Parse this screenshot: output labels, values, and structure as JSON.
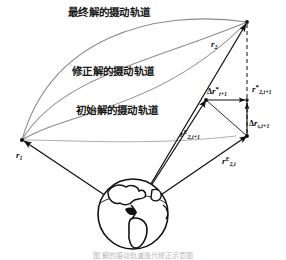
{
  "figure": {
    "background_color": "#ffffff",
    "ink_color": "#111111",
    "arc_color": "#8c8c8c",
    "title_caption": "图    解的摄动轨道迭代修正示意图"
  },
  "trajectory_labels": [
    {
      "id": "final",
      "text": "最终解的摄动轨道",
      "x": 68,
      "y": 7
    },
    {
      "id": "corrected",
      "text": "修正解的摄动轨道",
      "x": 72,
      "y": 66
    },
    {
      "id": "initial",
      "text": "初始解的摄动轨道",
      "x": 76,
      "y": 105
    }
  ],
  "vector_labels": [
    {
      "id": "r1",
      "base": "r",
      "sup": "",
      "sub": "1",
      "star": false,
      "x": 16,
      "y": 151
    },
    {
      "id": "r2",
      "base": "r",
      "sup": "",
      "sub": "2",
      "star": false,
      "x": 211,
      "y": 40
    },
    {
      "id": "r2E-ip1",
      "base": "r",
      "sup": "E",
      "sub": "2,i+1",
      "star": false,
      "x": 180,
      "y": 129
    },
    {
      "id": "r2E-i",
      "base": "r",
      "sup": "E",
      "sub": "2,i",
      "star": false,
      "x": 222,
      "y": 156
    },
    {
      "id": "delta-r-star-ip1",
      "base": "r",
      "sup": "",
      "sub": "i+1",
      "star": true,
      "delta": true,
      "x": 210,
      "y": 86
    },
    {
      "id": "r2-star-ip1",
      "base": "r",
      "sup": "",
      "sub": "2,i+1",
      "star": true,
      "x": 252,
      "y": 84
    },
    {
      "id": "delta-r-s-ip1",
      "base": "r",
      "sup": "",
      "sub": "s,i+1",
      "star": false,
      "delta": true,
      "x": 250,
      "y": 119
    }
  ],
  "geometry": {
    "origin_vertex": {
      "x": 22,
      "y": 140
    },
    "apex_vertex": {
      "x": 247,
      "y": 22
    },
    "earth_center": {
      "x": 133,
      "y": 214
    },
    "earth_radius": 35
  },
  "icons": {
    "earth": "earth-globe-icon"
  }
}
